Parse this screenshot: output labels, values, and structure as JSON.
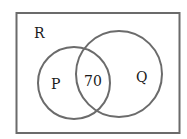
{
  "diagram": {
    "type": "venn",
    "universe": {
      "label": "R"
    },
    "sets": [
      {
        "label": "P"
      },
      {
        "label": "Q"
      }
    ],
    "intersection": {
      "value": "70"
    },
    "colors": {
      "stroke": "#6b6b6b",
      "frame": "#6b6b6b",
      "text": "#1a1a1a"
    }
  }
}
